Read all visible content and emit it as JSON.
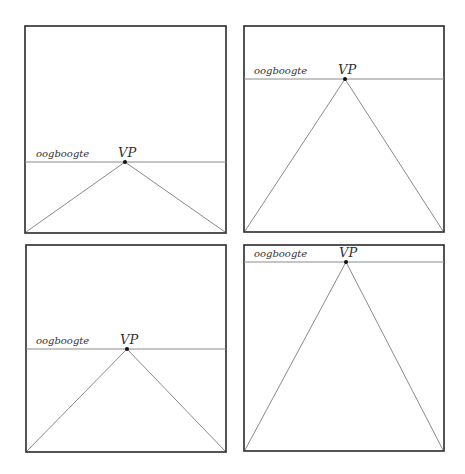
{
  "panels": [
    {
      "id": "top-left",
      "horizon_label": "oogboogte",
      "vp_label": "VP",
      "box": [
        25,
        26,
        226,
        233
      ],
      "horizon_y": 162,
      "vp_x": 125
    },
    {
      "id": "top-right",
      "horizon_label": "oogboogte",
      "vp_label": "VP",
      "box": [
        244,
        26,
        444,
        232
      ],
      "horizon_y": 79,
      "vp_x": 345
    },
    {
      "id": "bottom-left",
      "horizon_label": "oogboogte",
      "vp_label": "VP",
      "box": [
        26,
        245,
        226,
        452
      ],
      "horizon_y": 349,
      "vp_x": 127
    },
    {
      "id": "bottom-right",
      "horizon_label": "oogboogte",
      "vp_label": "VP",
      "box": [
        244,
        245,
        444,
        451
      ],
      "horizon_y": 262,
      "vp_x": 346
    }
  ],
  "colors": {
    "frame": "#2a2a2a",
    "line": "#8a8a8a",
    "vp": "#111111"
  }
}
